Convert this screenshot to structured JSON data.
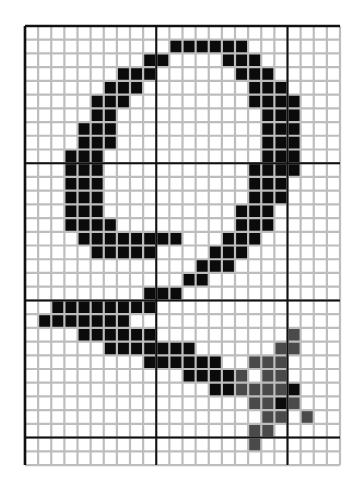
{
  "figure": {
    "title": "Bitmap glyph of handwritten digit 9 on a pixel grid",
    "grid": {
      "columns": 24,
      "rows": 32,
      "cell_width": 13.125,
      "cell_height": 13.72,
      "major_vertical_lines_at_columns": [
        0,
        10,
        20,
        24
      ],
      "major_horizontal_lines_at_rows": [
        0,
        10,
        20,
        30,
        32
      ]
    },
    "colors": {
      "background": "#ffffff",
      "minor_grid": "#bdbdbd",
      "major_grid": "#111111",
      "black_cell": "#0b0b0b",
      "gray_cell": "#4a4a4a"
    },
    "black_cells": [
      [
        1,
        11
      ],
      [
        1,
        12
      ],
      [
        1,
        13
      ],
      [
        1,
        14
      ],
      [
        1,
        15
      ],
      [
        1,
        16
      ],
      [
        2,
        9
      ],
      [
        2,
        10
      ],
      [
        2,
        15
      ],
      [
        2,
        16
      ],
      [
        2,
        17
      ],
      [
        3,
        7
      ],
      [
        3,
        8
      ],
      [
        3,
        9
      ],
      [
        3,
        16
      ],
      [
        3,
        17
      ],
      [
        3,
        18
      ],
      [
        4,
        6
      ],
      [
        4,
        7
      ],
      [
        4,
        8
      ],
      [
        4,
        17
      ],
      [
        4,
        18
      ],
      [
        4,
        19
      ],
      [
        5,
        5
      ],
      [
        5,
        6
      ],
      [
        5,
        7
      ],
      [
        5,
        17
      ],
      [
        5,
        18
      ],
      [
        5,
        19
      ],
      [
        5,
        20
      ],
      [
        6,
        5
      ],
      [
        6,
        6
      ],
      [
        6,
        18
      ],
      [
        6,
        19
      ],
      [
        6,
        20
      ],
      [
        7,
        4
      ],
      [
        7,
        5
      ],
      [
        7,
        6
      ],
      [
        7,
        18
      ],
      [
        7,
        19
      ],
      [
        7,
        20
      ],
      [
        8,
        4
      ],
      [
        8,
        5
      ],
      [
        8,
        6
      ],
      [
        8,
        18
      ],
      [
        8,
        19
      ],
      [
        8,
        20
      ],
      [
        9,
        3
      ],
      [
        9,
        4
      ],
      [
        9,
        5
      ],
      [
        9,
        18
      ],
      [
        9,
        19
      ],
      [
        9,
        20
      ],
      [
        10,
        3
      ],
      [
        10,
        4
      ],
      [
        10,
        5
      ],
      [
        10,
        17
      ],
      [
        10,
        18
      ],
      [
        10,
        19
      ],
      [
        10,
        20
      ],
      [
        11,
        3
      ],
      [
        11,
        4
      ],
      [
        11,
        5
      ],
      [
        11,
        17
      ],
      [
        11,
        18
      ],
      [
        11,
        19
      ],
      [
        12,
        3
      ],
      [
        12,
        4
      ],
      [
        12,
        5
      ],
      [
        12,
        17
      ],
      [
        12,
        18
      ],
      [
        12,
        19
      ],
      [
        13,
        3
      ],
      [
        13,
        4
      ],
      [
        13,
        5
      ],
      [
        13,
        16
      ],
      [
        13,
        17
      ],
      [
        13,
        18
      ],
      [
        14,
        3
      ],
      [
        14,
        4
      ],
      [
        14,
        5
      ],
      [
        14,
        6
      ],
      [
        14,
        16
      ],
      [
        14,
        17
      ],
      [
        14,
        18
      ],
      [
        15,
        4
      ],
      [
        15,
        5
      ],
      [
        15,
        6
      ],
      [
        15,
        7
      ],
      [
        15,
        8
      ],
      [
        15,
        9
      ],
      [
        15,
        10
      ],
      [
        15,
        11
      ],
      [
        15,
        15
      ],
      [
        15,
        16
      ],
      [
        15,
        17
      ],
      [
        16,
        5
      ],
      [
        16,
        6
      ],
      [
        16,
        7
      ],
      [
        16,
        8
      ],
      [
        16,
        9
      ],
      [
        16,
        14
      ],
      [
        16,
        15
      ],
      [
        16,
        16
      ],
      [
        17,
        13
      ],
      [
        17,
        14
      ],
      [
        17,
        15
      ],
      [
        18,
        12
      ],
      [
        18,
        13
      ],
      [
        19,
        9
      ],
      [
        19,
        10
      ],
      [
        19,
        11
      ],
      [
        20,
        2
      ],
      [
        20,
        3
      ],
      [
        20,
        4
      ],
      [
        20,
        5
      ],
      [
        20,
        6
      ],
      [
        20,
        7
      ],
      [
        20,
        8
      ],
      [
        20,
        9
      ],
      [
        21,
        1
      ],
      [
        21,
        2
      ],
      [
        21,
        3
      ],
      [
        21,
        4
      ],
      [
        21,
        5
      ],
      [
        21,
        6
      ],
      [
        21,
        7
      ],
      [
        22,
        4
      ],
      [
        22,
        5
      ],
      [
        22,
        6
      ],
      [
        22,
        7
      ],
      [
        22,
        8
      ],
      [
        22,
        9
      ],
      [
        23,
        6
      ],
      [
        23,
        7
      ],
      [
        23,
        8
      ],
      [
        23,
        9
      ],
      [
        23,
        10
      ],
      [
        23,
        11
      ],
      [
        23,
        12
      ],
      [
        24,
        9
      ],
      [
        24,
        10
      ],
      [
        24,
        11
      ],
      [
        24,
        12
      ],
      [
        24,
        13
      ],
      [
        24,
        14
      ],
      [
        25,
        12
      ],
      [
        25,
        13
      ],
      [
        25,
        14
      ],
      [
        25,
        15
      ],
      [
        26,
        14
      ],
      [
        26,
        15
      ],
      [
        26,
        20
      ],
      [
        27,
        19
      ]
    ],
    "gray_cells": [
      [
        22,
        20
      ],
      [
        23,
        19
      ],
      [
        23,
        20
      ],
      [
        24,
        17
      ],
      [
        24,
        18
      ],
      [
        24,
        19
      ],
      [
        25,
        16
      ],
      [
        25,
        18
      ],
      [
        25,
        19
      ],
      [
        26,
        16
      ],
      [
        26,
        17
      ],
      [
        26,
        18
      ],
      [
        26,
        19
      ],
      [
        27,
        17
      ],
      [
        27,
        18
      ],
      [
        27,
        20
      ],
      [
        28,
        18
      ],
      [
        28,
        19
      ],
      [
        28,
        21
      ],
      [
        29,
        17
      ],
      [
        29,
        18
      ],
      [
        30,
        17
      ]
    ]
  }
}
